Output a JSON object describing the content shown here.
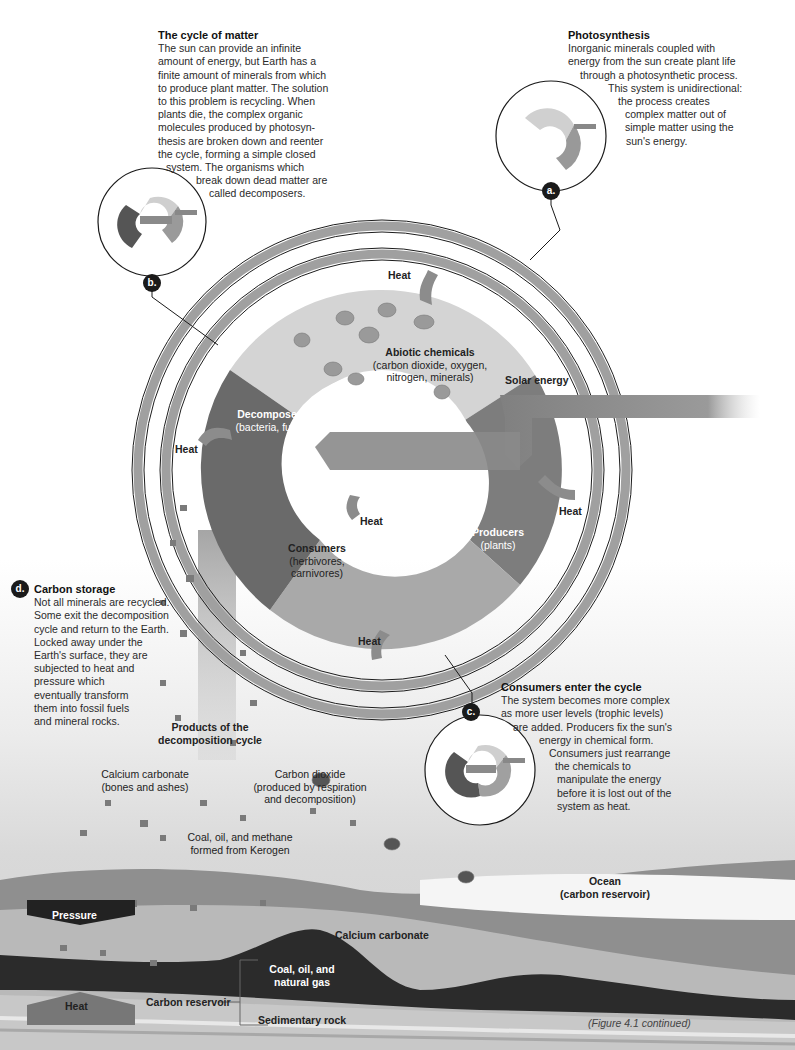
{
  "callouts": {
    "cycle_of_matter": {
      "title": "The cycle of matter",
      "lines": [
        "The sun can provide an infinite",
        "amount of energy, but Earth has a",
        "finite amount of minerals from which",
        "to produce plant matter. The solution",
        "to this problem is recycling. When",
        "plants die, the complex organic",
        "molecules produced by photosyn-",
        "thesis are broken down and reenter",
        "the cycle, forming a simple closed",
        "system. The organisms which",
        "break down dead matter are",
        "called decomposers."
      ],
      "badge": "b."
    },
    "photosynthesis": {
      "title": "Photosynthesis",
      "lines": [
        "Inorganic minerals coupled with",
        "energy from the sun create plant life",
        "through a photosynthetic process.",
        "This system is unidirectional:",
        "the process creates",
        "complex matter out of",
        "simple matter using the",
        "sun's energy."
      ],
      "badge": "a."
    },
    "carbon_storage": {
      "title": "Carbon storage",
      "lines": [
        "Not all minerals are recycled.",
        "Some exit the decomposition",
        "cycle and return to the Earth.",
        "Locked away under the",
        "Earth's surface, they are",
        "subjected to heat and",
        "pressure which",
        "eventually transform",
        "them into fossil fuels",
        "and mineral rocks."
      ],
      "badge": "d."
    },
    "consumers_enter": {
      "title": "Consumers enter the cycle",
      "lines": [
        "The system becomes more complex",
        "as more user levels (trophic levels)",
        "are added. Producers fix the sun's",
        "energy in chemical form.",
        "Consumers just rearrange",
        "the chemicals to",
        "manipulate the energy",
        "before it is lost out of the",
        "system as heat."
      ],
      "badge": "c."
    }
  },
  "cycle": {
    "abiotic": {
      "title": "Abiotic chemicals",
      "l1": "(carbon dioxide, oxygen,",
      "l2": "nitrogen, minerals)"
    },
    "decomposers": {
      "title": "Decomposers",
      "sub": "(bacteria, fungi)"
    },
    "producers": {
      "title": "Producers",
      "sub": "(plants)"
    },
    "consumers": {
      "title": "Consumers",
      "l1": "(herbivores,",
      "l2": "carnivores)"
    },
    "solar_energy": "Solar energy",
    "heat_labels": [
      "Heat",
      "Heat",
      "Heat",
      "Heat",
      "Heat"
    ],
    "molecules": [
      "O2",
      "H2",
      "CO2",
      "N2",
      "CO2",
      "H2O",
      "O2",
      "N2"
    ]
  },
  "decomposition": {
    "title_l1": "Products of the",
    "title_l2": "decomposition cycle",
    "calcium": {
      "l1": "Calcium carbonate",
      "l2": "(bones and ashes)"
    },
    "co2": {
      "l1": "Carbon dioxide",
      "l2": "(produced by respiration",
      "l3": "and decomposition)"
    },
    "coal": {
      "l1": "Coal, oil, and methane",
      "l2": "formed from Kerogen"
    },
    "co2_bubble": "CO2"
  },
  "ground": {
    "ocean": {
      "l1": "Ocean",
      "l2": "(carbon reservoir)"
    },
    "pressure": "Pressure",
    "heat": "Heat",
    "calcium_carbonate": "Calcium carbonate",
    "coal_gas": {
      "l1": "Coal, oil, and",
      "l2": "natural gas"
    },
    "carbon_reservoir": "Carbon reservoir",
    "sedimentary": "Sedimentary rock"
  },
  "caption": "(Figure 4.1 continued)",
  "colors": {
    "abiotic": "#d4d4d4",
    "decomposers": "#6a6a6a",
    "producers": "#7d7d7d",
    "consumers": "#a9a9a9",
    "ring": "#9a9a9a",
    "badge": "#1a1a1a",
    "coal": "#2b2b2b"
  }
}
